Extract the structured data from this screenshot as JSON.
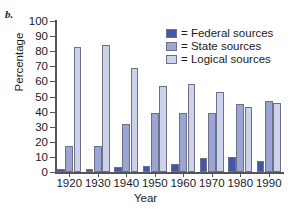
{
  "panel": {
    "label": "b."
  },
  "chart_data": {
    "type": "bar",
    "title": "",
    "xlabel": "Year",
    "ylabel": "Percentage",
    "categories": [
      "1920",
      "1930",
      "1940",
      "1950",
      "1960",
      "1970",
      "1980",
      "1990"
    ],
    "series": [
      {
        "name": "Federal sources",
        "color": "#4257a8",
        "values": [
          2,
          2,
          3,
          4,
          5,
          9,
          10,
          7
        ]
      },
      {
        "name": "State sources",
        "color": "#9aa5d4",
        "values": [
          17,
          17,
          32,
          39,
          39,
          39,
          45,
          47
        ]
      },
      {
        "name": "Logical sources",
        "color": "#ccd2ea",
        "values": [
          83,
          84,
          69,
          57,
          58,
          53,
          43,
          46
        ]
      }
    ],
    "ylim": [
      0,
      100
    ],
    "ytick_values": [
      0,
      10,
      20,
      30,
      40,
      50,
      60,
      70,
      80,
      90,
      100
    ],
    "ytick_labels": [
      "0",
      "10",
      "20",
      "30",
      "40",
      "50",
      "60",
      "70",
      "80",
      "90",
      "100"
    ],
    "grid": false,
    "legend_position": "upper right",
    "legend_prefix": "="
  },
  "legend": {
    "entries": [
      {
        "marker": "=",
        "label": "= Federal sources"
      },
      {
        "marker": "=",
        "label": "= State sources"
      },
      {
        "marker": "=",
        "label": "= Logical sources"
      }
    ]
  }
}
